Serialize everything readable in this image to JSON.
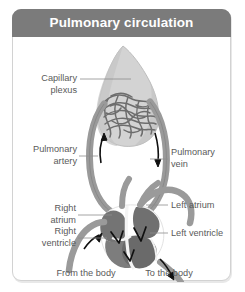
{
  "card": {
    "header": {
      "title": "Pulmonary circulation"
    },
    "colors": {
      "header_bg": "#7b7b7b",
      "header_text": "#ffffff",
      "card_bg": "#ffffff",
      "card_border": "#d2d2d2",
      "label_text": "#5a5a5a",
      "leader_line": "#8e8e8e",
      "lung_fill": "#d2d2d2",
      "lung_stroke": "#b4b4b4",
      "capillary": "#6f6f6f",
      "vessel_fill": "#9a9a9a",
      "vessel_stroke": "#7e7e7e",
      "chamber_fill": "#6e6e6e",
      "chamber_light": "#8f8f8f",
      "septum": "#f2f2f2",
      "valve": "#0d0d0d",
      "arrow": "#0d0d0d"
    }
  },
  "diagram": {
    "name": "pulmonary-circulation-diagram",
    "labels": {
      "capillary_plexus": "Capillary\nplexus",
      "pulmonary_artery": "Pulmonary\nartery",
      "right_atrium": "Right\natrium",
      "right_ventricle": "Right\nventricle",
      "pulmonary_vein": "Pulmonary\nvein",
      "left_atrium": "Left atrium",
      "left_ventricle": "Left ventricle",
      "from_the_body": "From the body",
      "to_the_body": "To the body"
    },
    "flow_arrows": [
      {
        "name": "pulmonary-artery-arrow",
        "direction": "up"
      },
      {
        "name": "pulmonary-vein-arrow",
        "direction": "down"
      },
      {
        "name": "vena-cava-arrow",
        "direction": "up-right"
      },
      {
        "name": "aorta-arrow",
        "direction": "down-right"
      }
    ]
  }
}
